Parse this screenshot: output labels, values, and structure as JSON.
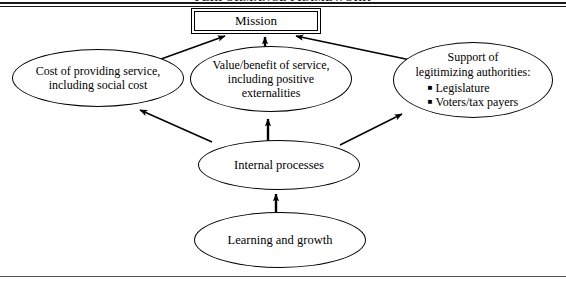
{
  "figure": {
    "clipped_header": "PERFORMANCE FRAMEWORK",
    "nodes": {
      "mission": {
        "label": "Mission",
        "shape": "double-rectangle"
      },
      "cost": {
        "line1": "Cost of providing service,",
        "line2": "including social cost",
        "shape": "ellipse"
      },
      "value": {
        "line1": "Value/benefit of service,",
        "line2": "including positive",
        "line3": "externalities",
        "shape": "ellipse"
      },
      "support": {
        "line1": "Support of",
        "line2": "legitimizing authorities:",
        "bullet_glyph": "■",
        "bullets": [
          "Legislature",
          "Voters/tax payers"
        ],
        "shape": "ellipse"
      },
      "internal": {
        "label": "Internal processes",
        "shape": "ellipse"
      },
      "learning": {
        "label": "Learning and growth",
        "shape": "ellipse"
      }
    },
    "edges": [
      {
        "from": "cost",
        "to": "mission",
        "style": "solid-arrow"
      },
      {
        "from": "value",
        "to": "mission",
        "style": "solid-arrow"
      },
      {
        "from": "support",
        "to": "mission",
        "style": "solid-arrow"
      },
      {
        "from": "internal",
        "to": "cost",
        "style": "solid-arrow"
      },
      {
        "from": "internal",
        "to": "value",
        "style": "solid-arrow"
      },
      {
        "from": "internal",
        "to": "support",
        "style": "solid-arrow"
      },
      {
        "from": "learning",
        "to": "internal",
        "style": "solid-arrow"
      }
    ],
    "colors": {
      "stroke": "#000000",
      "background": "#ffffff",
      "rule": "#1a1a1a"
    }
  }
}
